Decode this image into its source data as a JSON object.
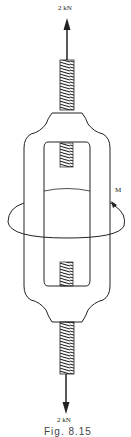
{
  "figure": {
    "top_force_label": "2 kN",
    "bottom_force_label": "2 kN",
    "moment_label": "M",
    "caption": "Fig. 8.15"
  },
  "components": {
    "top_arrow": "upward-force-arrow",
    "bottom_arrow": "downward-force-arrow",
    "top_screw": "threaded-rod",
    "bottom_screw": "threaded-rod",
    "frame": "turnbuckle-frame",
    "moment": "circular-moment-arrow"
  },
  "colors": {
    "line": "#222222",
    "background": "#ffffff"
  }
}
